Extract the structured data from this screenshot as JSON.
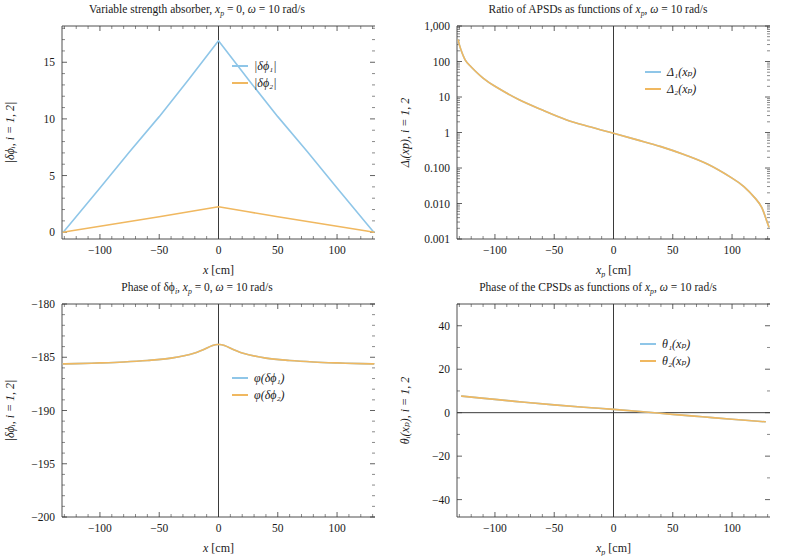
{
  "figure": {
    "width": 789,
    "height": 556,
    "background": "#ffffff",
    "series_colors": {
      "series1": "#8fc6e8",
      "series2": "#f0b860"
    },
    "axis_color": "#3a3a3a"
  },
  "chart_data": [
    {
      "id": "top-left",
      "type": "line",
      "title": "Variable strength absorber, x_p = 0, ω = 10 rad/s",
      "title_parts": {
        "lead": "Variable strength absorber, ",
        "var1": "x",
        "var1_sub": "p",
        "mid": " = 0, ",
        "var2": "ω",
        "tail": " = 10 rad/s"
      },
      "xlabel": "x [cm]",
      "xlabel_parts": {
        "sym": "x",
        "sub": "",
        "unit": " [cm]"
      },
      "ylabel": "|δϕᵢ, i = 1, 2|",
      "xlim": [
        -132,
        132
      ],
      "ylim": [
        -0.6,
        18.2
      ],
      "xticks": [
        -100,
        -50,
        0,
        50,
        100
      ],
      "xticklabels": [
        "-100",
        "-50",
        "0",
        "50",
        "100"
      ],
      "yticks": [
        0,
        5,
        10,
        15
      ],
      "yticklabels": [
        "0",
        "5",
        "10",
        "15"
      ],
      "yscale": "linear",
      "grid": false,
      "legend_position": "upper-right",
      "legend": [
        "|δϕ₁|",
        "|δϕ₂|"
      ],
      "series": [
        {
          "name": "|δϕ₁|",
          "color": "#8fc6e8",
          "x": [
            -131,
            -125,
            -100,
            -75,
            -50,
            -25,
            0,
            25,
            50,
            75,
            100,
            125,
            131
          ],
          "values": [
            0.0,
            0.75,
            3.9,
            7.1,
            10.2,
            13.5,
            16.9,
            13.5,
            10.2,
            7.1,
            3.9,
            0.75,
            0.0
          ]
        },
        {
          "name": "|δϕ₂|",
          "color": "#f0b860",
          "x": [
            -131,
            -125,
            -100,
            -75,
            -50,
            -25,
            0,
            25,
            50,
            75,
            100,
            125,
            131
          ],
          "values": [
            0.0,
            0.1,
            0.52,
            0.95,
            1.36,
            1.8,
            2.25,
            1.8,
            1.36,
            0.95,
            0.52,
            0.1,
            0.0
          ]
        }
      ]
    },
    {
      "id": "top-right",
      "type": "line",
      "title": "Ratio of APSDs as functions of x_p, ω = 10 rad/s",
      "title_parts": {
        "lead": "Ratio of APSDs as functions of ",
        "var1": "x",
        "var1_sub": "p",
        "mid": ", ",
        "var2": "ω",
        "tail": " = 10 rad/s"
      },
      "xlabel": "x_p [cm]",
      "xlabel_parts": {
        "sym": "x",
        "sub": "p",
        "unit": " [cm]"
      },
      "ylabel": "Δᵢ(xp), i = 1, 2",
      "xlim": [
        -132,
        132
      ],
      "ylim": [
        0.001,
        1000
      ],
      "xticks": [
        -100,
        -50,
        0,
        50,
        100
      ],
      "xticklabels": [
        "-100",
        "-50",
        "0",
        "50",
        "100"
      ],
      "yticks": [
        1000,
        100,
        10,
        1,
        0.1,
        0.01,
        0.001
      ],
      "yticklabels": [
        "1,000",
        "100",
        "10",
        "1",
        "0.100",
        "0.010",
        "0.001"
      ],
      "yscale": "log",
      "grid": false,
      "legend_position": "upper-right",
      "legend": [
        "Δ₁(xₚ)",
        "Δ₂(xₚ)"
      ],
      "series": [
        {
          "name": "Δ₁(xₚ)",
          "color": "#8fc6e8",
          "x": [
            -131,
            -129,
            -125,
            -120,
            -110,
            -100,
            -80,
            -60,
            -40,
            -20,
            0,
            20,
            40,
            60,
            80,
            100,
            110,
            120,
            125,
            129,
            131
          ],
          "values": [
            400,
            230,
            110,
            70,
            34,
            20,
            8.5,
            4.3,
            2.3,
            1.45,
            0.95,
            0.62,
            0.4,
            0.235,
            0.125,
            0.052,
            0.03,
            0.0135,
            0.0078,
            0.0034,
            0.0022
          ]
        },
        {
          "name": "Δ₂(xₚ)",
          "color": "#f0b860",
          "x": [
            -131,
            -129,
            -125,
            -120,
            -110,
            -100,
            -80,
            -60,
            -40,
            -20,
            0,
            20,
            40,
            60,
            80,
            100,
            110,
            120,
            125,
            129,
            131
          ],
          "values": [
            400,
            230,
            110,
            70,
            34,
            20,
            8.5,
            4.3,
            2.3,
            1.45,
            0.95,
            0.62,
            0.4,
            0.235,
            0.125,
            0.052,
            0.03,
            0.0135,
            0.0078,
            0.0034,
            0.0022
          ]
        }
      ]
    },
    {
      "id": "bottom-left",
      "type": "line",
      "title": "Phase of δϕᵢ, x_p = 0, ω = 10 rad/s",
      "title_parts": {
        "lead": "Phase of δϕ",
        "lead_sub": "i",
        "mid0": ", ",
        "var1": "x",
        "var1_sub": "p",
        "mid": " = 0, ",
        "var2": "ω",
        "tail": " = 10 rad/s"
      },
      "xlabel": "x [cm]",
      "xlabel_parts": {
        "sym": "x",
        "sub": "",
        "unit": " [cm]"
      },
      "ylabel": "|δϕᵢ, i = 1, 2|",
      "xlim": [
        -132,
        132
      ],
      "ylim": [
        -200,
        -180
      ],
      "xticks": [
        -100,
        -50,
        0,
        50,
        100
      ],
      "xticklabels": [
        "-100",
        "-50",
        "0",
        "50",
        "100"
      ],
      "yticks": [
        -180,
        -185,
        -190,
        -195,
        -200
      ],
      "yticklabels": [
        "-180",
        "-185",
        "-190",
        "-195",
        "-200"
      ],
      "yscale": "linear",
      "grid": false,
      "legend_position": "center-right",
      "legend": [
        "φ(δϕ₁)",
        "φ(δϕ₂)"
      ],
      "series": [
        {
          "name": "φ(δϕ₁)",
          "color": "#8fc6e8",
          "x": [
            -131,
            -120,
            -100,
            -80,
            -60,
            -40,
            -20,
            -5,
            0,
            5,
            20,
            40,
            60,
            80,
            100,
            120,
            131
          ],
          "values": [
            -185.62,
            -185.6,
            -185.53,
            -185.44,
            -185.3,
            -185.08,
            -184.6,
            -183.9,
            -183.8,
            -183.9,
            -184.6,
            -185.08,
            -185.3,
            -185.44,
            -185.53,
            -185.6,
            -185.62
          ]
        },
        {
          "name": "φ(δϕ₂)",
          "color": "#f0b860",
          "x": [
            -131,
            -120,
            -100,
            -80,
            -60,
            -40,
            -20,
            -5,
            0,
            5,
            20,
            40,
            60,
            80,
            100,
            120,
            131
          ],
          "values": [
            -185.62,
            -185.6,
            -185.53,
            -185.44,
            -185.3,
            -185.08,
            -184.6,
            -183.9,
            -183.8,
            -183.9,
            -184.6,
            -185.08,
            -185.3,
            -185.44,
            -185.53,
            -185.6,
            -185.62
          ]
        }
      ]
    },
    {
      "id": "bottom-right",
      "type": "line",
      "title": "Phase of the CPSDs as functions of x_p, ω = 10 rad/s",
      "title_parts": {
        "lead": "Phase of the CPSDs as functions of ",
        "var1": "x",
        "var1_sub": "p",
        "mid": ", ",
        "var2": "ω",
        "tail": " = 10 rad/s"
      },
      "xlabel": "x_p [cm]",
      "xlabel_parts": {
        "sym": "x",
        "sub": "p",
        "unit": " [cm]"
      },
      "ylabel": "θᵢ(xₚ), i = 1, 2",
      "xlim": [
        -132,
        132
      ],
      "ylim": [
        -48,
        50
      ],
      "xticks": [
        -100,
        -50,
        0,
        50,
        100
      ],
      "xticklabels": [
        "-100",
        "-50",
        "0",
        "50",
        "100"
      ],
      "yticks": [
        40,
        20,
        0,
        -20,
        -40
      ],
      "yticklabels": [
        "40",
        "20",
        "0",
        "-20",
        "-40"
      ],
      "yscale": "linear",
      "grid": false,
      "legend_position": "upper-right",
      "legend": [
        "θ₁(xₚ)",
        "θ₂(xₚ)"
      ],
      "series": [
        {
          "name": "θ₁(xₚ)",
          "color": "#8fc6e8",
          "x": [
            -128,
            -100,
            -75,
            -50,
            -25,
            0,
            25,
            50,
            75,
            100,
            128
          ],
          "values": [
            7.6,
            6.1,
            4.8,
            3.6,
            2.5,
            1.5,
            0.4,
            -0.8,
            -1.9,
            -3.0,
            -4.2
          ]
        },
        {
          "name": "θ₂(xₚ)",
          "color": "#f0b860",
          "x": [
            -128,
            -100,
            -75,
            -50,
            -25,
            0,
            25,
            50,
            75,
            100,
            128
          ],
          "values": [
            7.6,
            6.1,
            4.8,
            3.6,
            2.5,
            1.5,
            0.4,
            -0.8,
            -1.9,
            -3.0,
            -4.2
          ]
        }
      ]
    }
  ]
}
